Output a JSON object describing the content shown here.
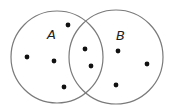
{
  "diagram": {
    "type": "venn",
    "stroke_color": "#7a7a7a",
    "dot_color": "#111111",
    "sets": [
      {
        "id": "A",
        "label": "A",
        "cx": 57,
        "cy": 57,
        "r": 46,
        "label_x": 47,
        "label_y": 39
      },
      {
        "id": "B",
        "label": "B",
        "cx": 116,
        "cy": 57,
        "r": 47,
        "label_x": 116,
        "label_y": 40
      }
    ],
    "elements": [
      {
        "region": "A only",
        "x": 68,
        "y": 25
      },
      {
        "region": "A only",
        "x": 27,
        "y": 57
      },
      {
        "region": "A only",
        "x": 54,
        "y": 61
      },
      {
        "region": "A only",
        "x": 64,
        "y": 87
      },
      {
        "region": "A and B",
        "x": 85,
        "y": 49
      },
      {
        "region": "A and B",
        "x": 91,
        "y": 66
      },
      {
        "region": "B only",
        "x": 118,
        "y": 51
      },
      {
        "region": "B only",
        "x": 147,
        "y": 64
      },
      {
        "region": "B only",
        "x": 116,
        "y": 85
      }
    ],
    "counts": {
      "A_only": 4,
      "A_and_B": 2,
      "B_only": 3
    }
  }
}
